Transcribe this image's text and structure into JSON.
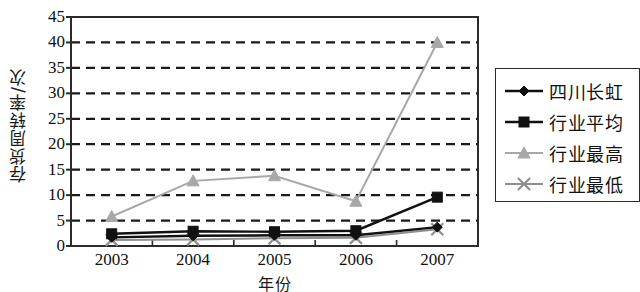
{
  "chart_data": {
    "type": "line",
    "title": "",
    "xlabel": "年份",
    "ylabel": "存货周转率/次",
    "x": [
      "2003",
      "2004",
      "2005",
      "2006",
      "2007"
    ],
    "categories": [
      "2003",
      "2004",
      "2005",
      "2006",
      "2007"
    ],
    "xticklabels": [
      "2003",
      "2004",
      "2005",
      "2006",
      "2007"
    ],
    "yticklabels": [
      "0",
      "5",
      "10",
      "15",
      "20",
      "25",
      "30",
      "35",
      "40",
      "45"
    ],
    "ylim": [
      0,
      45
    ],
    "ytick_step": 5,
    "grid": "horizontal-dashed",
    "legend_position": "right-outside",
    "series": [
      {
        "name": "四川长虹",
        "marker": "diamond",
        "color": "#111111",
        "values": [
          1.7,
          2.0,
          2.1,
          2.1,
          3.7
        ]
      },
      {
        "name": "行业平均",
        "marker": "square",
        "color": "#111111",
        "values": [
          2.4,
          2.9,
          2.8,
          3.0,
          9.6
        ]
      },
      {
        "name": "行业最高",
        "marker": "triangle",
        "color": "#a8a8a8",
        "values": [
          5.8,
          12.8,
          13.8,
          8.8,
          40.0
        ]
      },
      {
        "name": "行业最低",
        "marker": "cross",
        "color": "#8f8f8f",
        "values": [
          1.2,
          1.3,
          1.5,
          1.6,
          3.3
        ]
      }
    ]
  },
  "legend": {
    "entries": [
      {
        "label": "四川长虹",
        "marker": "diamond-marker-icon",
        "color": "#111111"
      },
      {
        "label": "行业平均",
        "marker": "square-marker-icon",
        "color": "#111111"
      },
      {
        "label": "行业最高",
        "marker": "triangle-marker-icon",
        "color": "#a8a8a8"
      },
      {
        "label": "行业最低",
        "marker": "cross-marker-icon",
        "color": "#8f8f8f"
      }
    ]
  },
  "axes": {
    "y_axis_title": "存货周转率/次",
    "x_axis_title": "年份"
  },
  "colors": {
    "axis": "#2b2b2b",
    "grid": "#1a1a1a",
    "background": "#ffffff",
    "dark_series": "#111111",
    "light_series": "#a8a8a8"
  }
}
